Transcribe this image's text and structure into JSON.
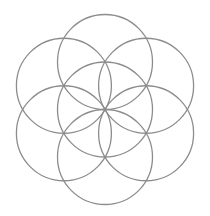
{
  "figure": {
    "name": "Seed of Life",
    "background": "#ffffff",
    "stroke_color": "#8c8c8c",
    "stroke_width": 1.3,
    "center": {
      "x": 105,
      "y": 109.5
    },
    "radius": 47.5,
    "circle_count": 7,
    "circles": [
      {
        "id": "center",
        "cx": 105.0,
        "cy": 109.5
      },
      {
        "id": "top",
        "cx": 105.0,
        "cy": 62.0
      },
      {
        "id": "top-right",
        "cx": 146.1,
        "cy": 85.75
      },
      {
        "id": "bottom-right",
        "cx": 146.1,
        "cy": 133.25
      },
      {
        "id": "bottom",
        "cx": 105.0,
        "cy": 157.0
      },
      {
        "id": "bottom-left",
        "cx": 63.9,
        "cy": 133.25
      },
      {
        "id": "top-left",
        "cx": 63.9,
        "cy": 85.75
      }
    ]
  }
}
